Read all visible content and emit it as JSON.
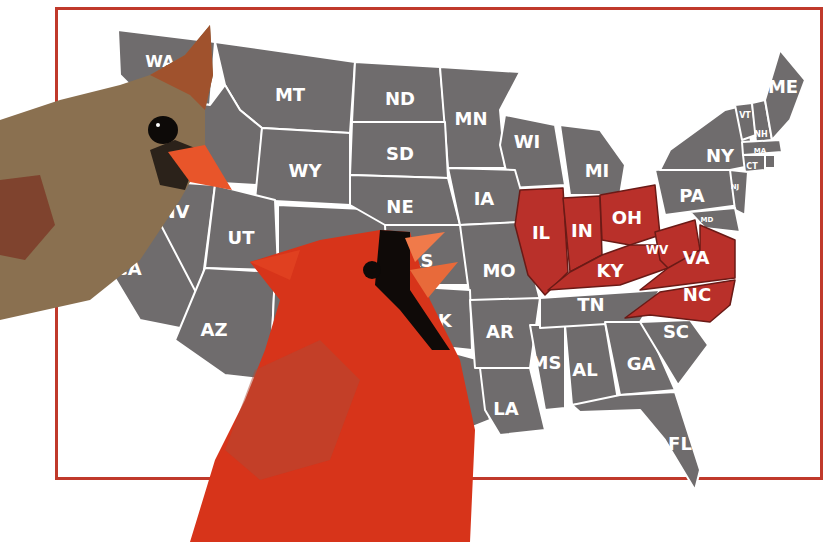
{
  "map": {
    "title": "Northern Cardinal state birds",
    "frame_color": "#c0392b",
    "state_fill": "#6f6c6d",
    "highlight_fill": "#b9302a",
    "label_color": "#ffffff",
    "highlighted_states": [
      "IL",
      "IN",
      "OH",
      "KY",
      "WV",
      "VA",
      "NC"
    ],
    "labels": {
      "WA": "WA",
      "MT": "MT",
      "ND": "ND",
      "MN": "MN",
      "WI": "WI",
      "MI": "MI",
      "ME": "ME",
      "ID": "ID",
      "SD": "SD",
      "WY": "WY",
      "NY": "NY",
      "VT": "VT",
      "NH": "NH",
      "MA": "MA",
      "CT": "CT",
      "RI": "RI",
      "NJ": "NJ",
      "MD": "MD",
      "PA": "PA",
      "NV": "NV",
      "UT": "UT",
      "NE": "NE",
      "IA": "IA",
      "IL": "IL",
      "IN": "IN",
      "OH": "OH",
      "CA": "CA",
      "KS": "KS",
      "MO": "MO",
      "KY": "KY",
      "WV": "WV",
      "VA": "VA",
      "AZ": "AZ",
      "OK": "OK",
      "AR": "AR",
      "TN": "TN",
      "NC": "NC",
      "SC": "SC",
      "MS": "MS",
      "AL": "AL",
      "GA": "GA",
      "LA": "LA",
      "FL": "FL"
    }
  },
  "birds": [
    {
      "name": "female cardinal",
      "position": "left",
      "colors": {
        "body": "#8a7050",
        "crest": "#a0522d",
        "beak": "#e8552a",
        "mask": "#1a1410"
      }
    },
    {
      "name": "male cardinal",
      "position": "center",
      "colors": {
        "body": "#d7341a",
        "mask": "#0f0a08",
        "beak": "#f07a4a"
      }
    }
  ]
}
